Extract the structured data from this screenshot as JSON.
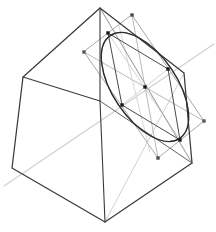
{
  "figure": {
    "title": "Cube with inscribed ellipse cross-section",
    "width": 216,
    "height": 232,
    "background_color": "#ffffff"
  },
  "colors": {
    "cube_edge": "#3a3a3a",
    "cube_edge_light": "#6e6e6e",
    "ellipse_dark": "#2b2b2b",
    "ellipse_light": "#8c8c8c",
    "quad_gray": "#9a9a9a",
    "helper_gray": "#b4b4b4",
    "axis_light": "#cfcfcf",
    "marker_fill": "#1a1a1a"
  },
  "strokes": {
    "cube_width": 1.25,
    "cube_inner_width": 1.0,
    "ellipse_width": 1.35,
    "ellipse_light_width": 1.0,
    "quad_width": 0.85,
    "helper_width": 0.8,
    "axis_width": 1.0
  },
  "chart_data": {
    "type": "diagram",
    "title": "Cube with inscribed ellipse cross-section",
    "projection": "oblique / isometric-like",
    "cube": {
      "name": "cube-outline",
      "silhouette_vertices": [
        {
          "id": "top",
          "x": 100,
          "y": 8
        },
        {
          "id": "upper-right",
          "x": 184,
          "y": 73
        },
        {
          "id": "right",
          "x": 192,
          "y": 163
        },
        {
          "id": "bottom",
          "x": 105,
          "y": 222
        },
        {
          "id": "bottom-left",
          "x": 12,
          "y": 168
        },
        {
          "id": "left",
          "x": 23,
          "y": 77
        }
      ],
      "front_corner": {
        "id": "front",
        "x": 100,
        "y": 101
      },
      "inner_edges": [
        {
          "from": "front",
          "to": "top"
        },
        {
          "from": "front",
          "to": "left"
        },
        {
          "from": "front",
          "to": "bottom"
        }
      ],
      "hidden_helper_edges": [
        {
          "from": "top",
          "to": "right"
        },
        {
          "from": "upper-right",
          "to": "bottom"
        }
      ]
    },
    "ellipse": {
      "name": "cross-section-ellipse",
      "center": {
        "x": 145,
        "y": 87
      },
      "semi_major": 62,
      "semi_minor": 32,
      "rotation_deg": 56,
      "tangent_points": [
        {
          "id": "t-upper-left",
          "x": 108,
          "y": 33
        },
        {
          "id": "t-right",
          "x": 168,
          "y": 69
        },
        {
          "id": "t-lower-right",
          "x": 180,
          "y": 140
        },
        {
          "id": "t-left",
          "x": 122,
          "y": 105
        }
      ]
    },
    "parallelogram": {
      "name": "circumscribing-parallelogram",
      "vertices": [
        {
          "id": "q-top",
          "x": 132,
          "y": 15
        },
        {
          "id": "q-right",
          "x": 204,
          "y": 121
        },
        {
          "id": "q-bottom",
          "x": 158,
          "y": 158
        },
        {
          "id": "q-left",
          "x": 84,
          "y": 52
        }
      ],
      "diagonals": [
        {
          "from": "q-top",
          "to": "q-bottom"
        },
        {
          "from": "q-left",
          "to": "q-right"
        }
      ]
    },
    "axis_line": {
      "name": "section-plane-axis",
      "from": {
        "x": 4,
        "y": 186
      },
      "to": {
        "x": 214,
        "y": 44
      },
      "color": "#cfcfcf"
    },
    "markers": {
      "shape": "square",
      "size_px": 3.4,
      "points": [
        {
          "id": "m-center",
          "x": 145,
          "y": 87,
          "role": "ellipse-center"
        },
        {
          "id": "m-q-top",
          "x": 132,
          "y": 15,
          "role": "parallelogram-vertex"
        },
        {
          "id": "m-q-left",
          "x": 84,
          "y": 52,
          "role": "parallelogram-vertex"
        },
        {
          "id": "m-q-right",
          "x": 204,
          "y": 121,
          "role": "parallelogram-vertex"
        },
        {
          "id": "m-q-bottom",
          "x": 158,
          "y": 158,
          "role": "parallelogram-vertex"
        },
        {
          "id": "m-t-upper-left",
          "x": 108,
          "y": 33,
          "role": "tangent-point"
        },
        {
          "id": "m-t-right",
          "x": 168,
          "y": 69,
          "role": "tangent-point"
        },
        {
          "id": "m-t-lower-right",
          "x": 180,
          "y": 140,
          "role": "tangent-point"
        },
        {
          "id": "m-t-left",
          "x": 122,
          "y": 105,
          "role": "tangent-point"
        }
      ]
    }
  }
}
